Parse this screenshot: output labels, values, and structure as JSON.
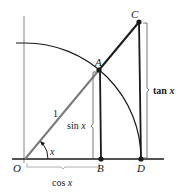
{
  "diagram": {
    "colors": {
      "line": "#1a1a1a",
      "radius": "#7a7a7a",
      "bracket": "#555555",
      "background": "#ffffff"
    },
    "points": {
      "O": {
        "label": "O",
        "x": 25,
        "y": 159
      },
      "A": {
        "label": "A",
        "x": 99,
        "y": 70
      },
      "B": {
        "label": "B",
        "x": 101,
        "y": 159
      },
      "C": {
        "label": "C",
        "x": 139,
        "y": 22
      },
      "D": {
        "label": "D",
        "x": 141,
        "y": 159
      }
    },
    "labels": {
      "radius": "1",
      "angle": "x",
      "sin_fn": "sin",
      "sin_var": "x",
      "cos_fn": "cos",
      "cos_var": "x",
      "tan_fn": "tan",
      "tan_var": "x"
    }
  }
}
